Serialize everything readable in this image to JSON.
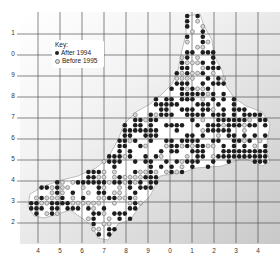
{
  "map": {
    "type": "species distribution atlas map",
    "region_shape": "peninsula (south-west England style outline)",
    "key": {
      "title": "Key:",
      "entries": [
        {
          "symbol": "filled-dot-icon",
          "label": "After 1994",
          "color": "#222222"
        },
        {
          "symbol": "open-dot-icon",
          "label": "Before 1995",
          "color": "#888888"
        }
      ]
    },
    "y_axis_labels": [
      "1",
      "0",
      "9",
      "8",
      "7",
      "6",
      "5",
      "4",
      "3",
      "2"
    ],
    "x_axis_labels": [
      "4",
      "5",
      "6",
      "7",
      "8",
      "9",
      "0",
      "1",
      "2",
      "3",
      "4"
    ],
    "colors": {
      "land": "#ffffff",
      "sea_light": "#f6f6f6",
      "sea_dark": "#cfcfcf",
      "grid": "#555555",
      "dot_after": "#1e1e1e",
      "dot_before_fill": "#d8d8d8",
      "dot_before_stroke": "#7a7a7a"
    }
  }
}
